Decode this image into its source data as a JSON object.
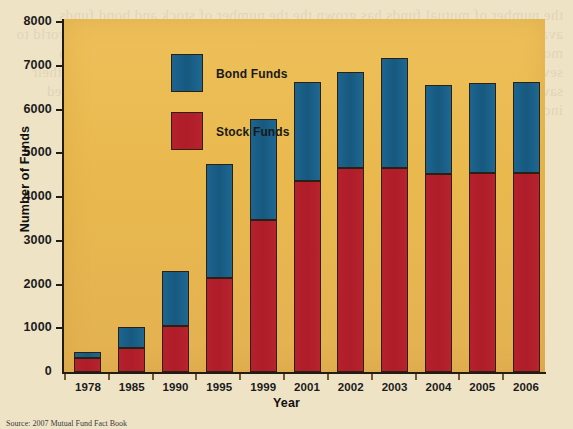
{
  "figure": {
    "source_note": "Source:  2007 Mutual Fund Fact Book",
    "ghost_text": "the number of mutual funds has grown the the number of stock and bond funds available to investors has grown steadily in the United States and around the world to more than 8000 funds and the total of assets under management has climbed to several trillions of dollars as investors continue to allocate a growing share of their savings into these diversified pooled investment vehicles across equity and fixed income categories"
  },
  "chart_data": {
    "type": "bar",
    "subtype": "stacked",
    "title": "",
    "xlabel": "Year",
    "ylabel": "Number of Funds",
    "ylim": [
      0,
      8000
    ],
    "yticks": [
      0,
      1000,
      2000,
      3000,
      4000,
      5000,
      6000,
      7000,
      8000
    ],
    "ytick_labels": [
      "0",
      "1000",
      "2000",
      "3000",
      "4000",
      "5000",
      "6000",
      "7000",
      "8000"
    ],
    "grid": false,
    "legend_position": "upper-left-inside",
    "categories": [
      "1978",
      "1985",
      "1990",
      "1995",
      "1999",
      "2001",
      "2002",
      "2003",
      "2004",
      "2005",
      "2006"
    ],
    "series": [
      {
        "name": "Stock Funds",
        "color": "#b4202c",
        "values": [
          310,
          540,
          1060,
          2140,
          3470,
          4370,
          4670,
          4670,
          4520,
          4550,
          4550
        ]
      },
      {
        "name": "Bond Funds",
        "color": "#1d6390",
        "values": [
          140,
          480,
          1250,
          2620,
          2310,
          2270,
          2180,
          2500,
          2030,
          2050,
          2070
        ]
      }
    ],
    "totals": [
      450,
      1020,
      2310,
      4760,
      5780,
      6640,
      6850,
      7170,
      6550,
      6600,
      6620
    ],
    "legend_order": [
      "Bond Funds",
      "Stock Funds"
    ],
    "colors": {
      "plot_background": "#e9b94e",
      "page_background": "#efe3c6",
      "axis": "#231c14",
      "stock": "#b4202c",
      "bond": "#1d6390"
    }
  }
}
